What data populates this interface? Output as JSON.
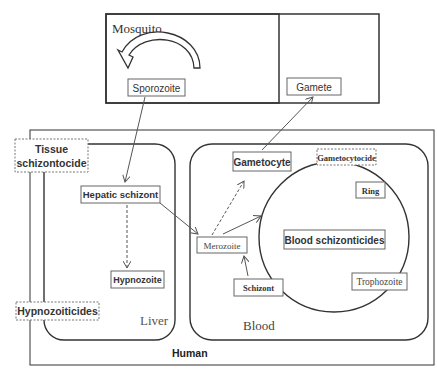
{
  "colors": {
    "line": "#2a2a2a",
    "box_border": "#555555",
    "arrow_red": "#b04040",
    "background": "#ffffff"
  },
  "mosquito": {
    "label": "Mosquito",
    "nodes": {
      "sporozoite": "Sporozoite",
      "gamete": "Gamete"
    }
  },
  "human": {
    "label": "Human",
    "drug_labels": {
      "tissue_schizontocide_line1": "Tissue",
      "tissue_schizontocide_line2": "schizontocide",
      "hypnozoiticides": "Hypnozoiticides"
    },
    "liver": {
      "label": "Liver",
      "nodes": {
        "hepatic_schizont": "Hepatic schizont",
        "hypnozoite": "Hypnozoite"
      }
    },
    "blood": {
      "label": "Blood",
      "gametocytocide": "Gametocytocide",
      "nodes": {
        "gametocyte": "Gametocyte",
        "merozoite": "Merozoite",
        "schizont": "Schizont",
        "blood_schizonticides": "Blood schizonticides",
        "ring": "Ring",
        "trophozoite": "Trophozoite"
      }
    }
  },
  "edges": [
    {
      "from": "Gamete",
      "to": "Sporozoite",
      "style": "curved-block-arrow"
    },
    {
      "from": "Sporozoite",
      "to": "Hepatic schizont",
      "style": "solid"
    },
    {
      "from": "Hepatic schizont",
      "to": "Hypnozoite",
      "style": "dashed"
    },
    {
      "from": "Hepatic schizont",
      "to": "Merozoite",
      "style": "solid"
    },
    {
      "from": "Merozoite",
      "to": "Gametocyte",
      "style": "dashed"
    },
    {
      "from": "Merozoite",
      "to": "Blood cycle",
      "style": "solid"
    },
    {
      "from": "Schizont",
      "to": "Merozoite",
      "style": "solid"
    },
    {
      "from": "Gametocyte",
      "to": "Gamete",
      "style": "solid"
    }
  ]
}
